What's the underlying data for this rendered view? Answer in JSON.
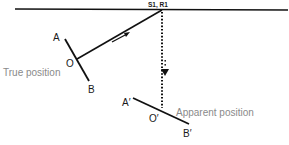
{
  "diagram": {
    "labels": {
      "source_receiver": "S1, R1",
      "a": "A",
      "o": "O",
      "b": "B",
      "true_position": "True position",
      "a_prime": "A′",
      "o_prime": "O′",
      "b_prime": "B′",
      "apparent_position": "Apparent position"
    },
    "colors": {
      "line": "#111111",
      "label": "#1a1a1a",
      "caption": "#8a8a8a"
    }
  }
}
